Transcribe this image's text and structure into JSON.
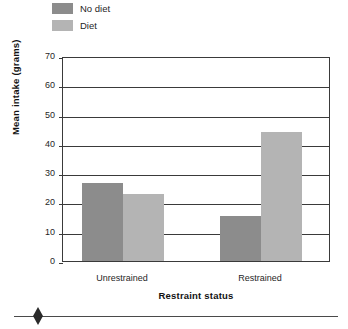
{
  "chart_data": {
    "type": "bar",
    "title": "",
    "subtitle": "",
    "xlabel": "Restraint status",
    "ylabel": "Mean intake (grams)",
    "categories": [
      "Unrestrained",
      "Restrained"
    ],
    "series": [
      {
        "name": "No diet",
        "color": "#8c8c8c",
        "values": [
          26.5,
          15.5
        ]
      },
      {
        "name": "Diet",
        "color": "#b4b4b4",
        "values": [
          23.0,
          44.0
        ]
      }
    ],
    "ylim": [
      0,
      70
    ],
    "ytick_labels": [
      "70",
      "60",
      "50",
      "40",
      "30",
      "20",
      "10",
      "0"
    ],
    "ytick_values": [
      70,
      60,
      50,
      40,
      30,
      20,
      10,
      0
    ],
    "grid": "horizontal",
    "legend_position": "top-left",
    "legend": [
      {
        "label": "No diet",
        "color": "#8c8c8c"
      },
      {
        "label": "Diet",
        "color": "#b4b4b4"
      }
    ]
  },
  "footer": {
    "ornament": "diamond"
  }
}
